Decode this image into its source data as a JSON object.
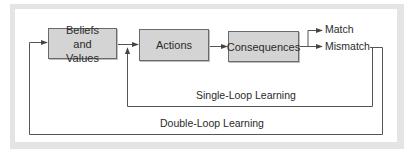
{
  "diagram": {
    "boxes": {
      "beliefs": "Beliefs and Values",
      "actions": "Actions",
      "consequences": "Consequences"
    },
    "outcomes": {
      "match": "Match",
      "mismatch": "Mismatch"
    },
    "loops": {
      "single": "Single-Loop Learning",
      "double": "Double-Loop Learning"
    },
    "colors": {
      "box_fill": "#d4d4d4",
      "line": "#555555",
      "frame": "#e4e4e4"
    }
  }
}
